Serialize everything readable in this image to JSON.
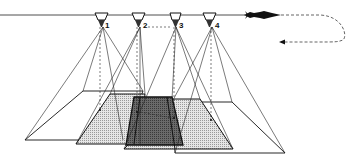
{
  "diagram": {
    "cameras": [
      {
        "id": "camera-1",
        "label": "1",
        "x": 103
      },
      {
        "id": "camera-2",
        "label": "2",
        "x": 140
      },
      {
        "id": "camera-3",
        "label": "3",
        "x": 176
      },
      {
        "id": "camera-4",
        "label": "4",
        "x": 212
      }
    ],
    "aircraft": {
      "icon": "aircraft-icon",
      "direction": "left"
    },
    "flight_path": {
      "style": "dashed",
      "turn": "right-hand U-turn, return leg to the left"
    },
    "colors": {
      "line": "#111111",
      "light_fill": "#d4d4d4",
      "dark_fill": "#5a5a5a",
      "background": "#ffffff"
    }
  }
}
